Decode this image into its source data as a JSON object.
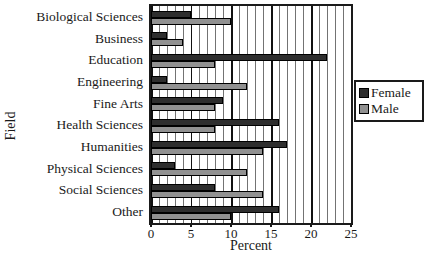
{
  "chart_data": {
    "type": "bar",
    "orientation": "horizontal",
    "title": "",
    "xlabel": "Percent",
    "ylabel": "Field",
    "xlim": [
      0,
      25
    ],
    "xticks": [
      0,
      5,
      10,
      15,
      20,
      25
    ],
    "minor_grid_step": 1,
    "major_grid_step": 5,
    "grid": "vertical",
    "legend_position": "right",
    "categories": [
      "Biological Sciences",
      "Business",
      "Education",
      "Engineering",
      "Fine Arts",
      "Health Sciences",
      "Humanities",
      "Physical Sciences",
      "Social Sciences",
      "Other"
    ],
    "series": [
      {
        "name": "Female",
        "color": "#2e2e2e",
        "values": [
          5,
          2,
          22,
          2,
          9,
          16,
          17,
          3,
          8,
          16
        ]
      },
      {
        "name": "Male",
        "color": "#919191",
        "values": [
          10,
          4,
          8,
          12,
          8,
          8,
          14,
          12,
          14,
          10
        ]
      }
    ]
  },
  "colors": {
    "female_bar": "#2e2e2e",
    "male_bar": "#919191",
    "axis": "#1a1a1a",
    "background": "#ffffff"
  }
}
